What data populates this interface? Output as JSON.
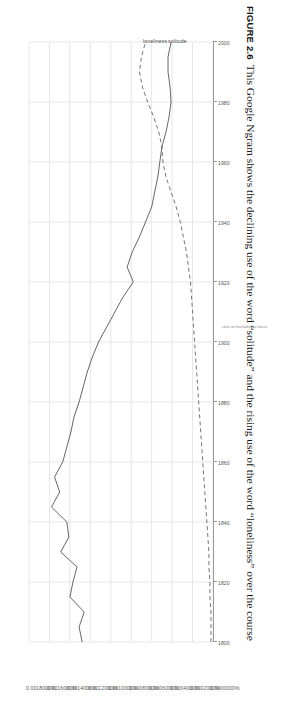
{
  "figure": {
    "number_label": "FIGURE 2.6",
    "caption": "This Google Ngram shows the declining use of the word “solitude” and the rising use of the word “loneliness” over the course"
  },
  "chart_note": "click on line/label for focus",
  "chart_data": {
    "type": "line",
    "title": "",
    "xlabel": "",
    "ylabel": "",
    "xlim": [
      1800,
      2000
    ],
    "ylim": [
      0.0,
      0.0018
    ],
    "grid": true,
    "legend_position": "line-end-labels",
    "x_ticks": [
      "1800",
      "1820",
      "1840",
      "1860",
      "1880",
      "1900",
      "1920",
      "1940",
      "1960",
      "1980",
      "2000"
    ],
    "y_ticks": [
      "0.0018000%",
      "0.0016000%",
      "0.0014000%",
      "0.0012000%",
      "0.0010000%",
      "0.0008000%",
      "0.0006000%",
      "0.0004000%",
      "0.0002000%",
      "0.0000000%"
    ],
    "x": [
      1800,
      1805,
      1810,
      1815,
      1820,
      1825,
      1830,
      1835,
      1840,
      1845,
      1850,
      1855,
      1860,
      1865,
      1870,
      1875,
      1880,
      1885,
      1890,
      1895,
      1900,
      1905,
      1910,
      1915,
      1920,
      1925,
      1930,
      1935,
      1940,
      1945,
      1950,
      1955,
      1960,
      1965,
      1970,
      1975,
      1980,
      1985,
      1990,
      1995,
      2000
    ],
    "series": [
      {
        "name": "solitude",
        "style": "solid",
        "color": "#555555",
        "values": [
          0.00128,
          0.00131,
          0.00126,
          0.0014,
          0.00137,
          0.00133,
          0.00149,
          0.00141,
          0.00143,
          0.00158,
          0.0015,
          0.00155,
          0.00147,
          0.00143,
          0.00139,
          0.00136,
          0.00131,
          0.00127,
          0.00123,
          0.00118,
          0.00112,
          0.00104,
          0.00096,
          0.00088,
          0.00078,
          0.00084,
          0.00079,
          0.00072,
          0.00066,
          0.0006,
          0.00057,
          0.00054,
          0.00052,
          0.0005,
          0.00046,
          0.00043,
          0.00041,
          0.00042,
          0.00044,
          0.00044,
          0.00041
        ]
      },
      {
        "name": "loneliness",
        "style": "dashed",
        "color": "#666666",
        "values": [
          2e-05,
          2e-05,
          2e-05,
          3e-05,
          3e-05,
          4e-05,
          4e-05,
          5e-05,
          6e-05,
          7e-05,
          8e-05,
          9e-05,
          0.0001,
          0.00011,
          0.00012,
          0.00013,
          0.00014,
          0.00015,
          0.00016,
          0.00017,
          0.00018,
          0.00019,
          0.0002,
          0.00021,
          0.00022,
          0.00024,
          0.00026,
          0.00029,
          0.00032,
          0.00036,
          0.00041,
          0.00046,
          0.00049,
          0.0005,
          0.00053,
          0.00058,
          0.00064,
          0.00069,
          0.00072,
          0.0007,
          0.00066
        ]
      }
    ]
  }
}
